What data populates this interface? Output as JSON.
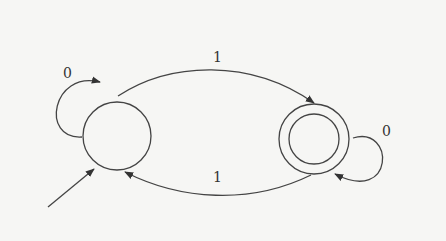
{
  "diagram": {
    "type": "finite-state-automaton",
    "states": [
      {
        "id": "q0",
        "label": "",
        "start": true,
        "accepting": false
      },
      {
        "id": "q1",
        "label": "",
        "start": false,
        "accepting": true
      }
    ],
    "transitions": [
      {
        "from": "q0",
        "to": "q0",
        "symbol": "0"
      },
      {
        "from": "q0",
        "to": "q1",
        "symbol": "1"
      },
      {
        "from": "q1",
        "to": "q0",
        "symbol": "1"
      },
      {
        "from": "q1",
        "to": "q1",
        "symbol": "0"
      }
    ],
    "labels": {
      "q0_self": "0",
      "q0_to_q1": "1",
      "q1_to_q0": "1",
      "q1_self": "0"
    },
    "colors": {
      "stroke": "#444444",
      "background": "#f6f6f4"
    }
  }
}
